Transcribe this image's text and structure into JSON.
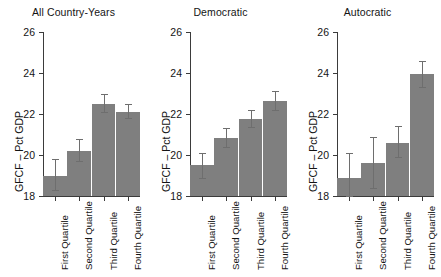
{
  "figure": {
    "width": 441,
    "height": 277,
    "bar_color": "#7f7f7f",
    "axis_color": "#3b3b3b",
    "error_color": "#6e6e6e",
    "background": "#ffffff"
  },
  "chart_data": {
    "type": "bar",
    "title": "",
    "xlabel": "",
    "ylabel": "GFCF – Pct GDP",
    "ylim": [
      18,
      26
    ],
    "yticks": [
      18,
      20,
      22,
      24,
      26
    ],
    "ytick_labels": [
      "18",
      "20",
      "22",
      "24",
      "26"
    ],
    "grid": false,
    "legend": "none",
    "categories": [
      "First Quartile",
      "Second Quartile",
      "Third Quartile",
      "Fourth Quartile"
    ],
    "panels": [
      {
        "title": "All Country-Years",
        "values": [
          19.0,
          20.2,
          22.5,
          22.1
        ],
        "err_low": [
          18.3,
          19.7,
          22.1,
          21.8
        ],
        "err_high": [
          19.8,
          20.8,
          23.0,
          22.5
        ]
      },
      {
        "title": "Democratic",
        "values": [
          19.5,
          20.85,
          21.75,
          22.65
        ],
        "err_low": [
          18.9,
          20.4,
          21.35,
          22.2
        ],
        "err_high": [
          20.1,
          21.3,
          22.2,
          23.1
        ]
      },
      {
        "title": "Autocratic",
        "values": [
          18.9,
          19.6,
          20.6,
          23.95
        ],
        "err_low": [
          18.0,
          18.4,
          19.9,
          23.3
        ],
        "err_high": [
          20.1,
          20.9,
          21.4,
          24.6
        ]
      }
    ]
  }
}
